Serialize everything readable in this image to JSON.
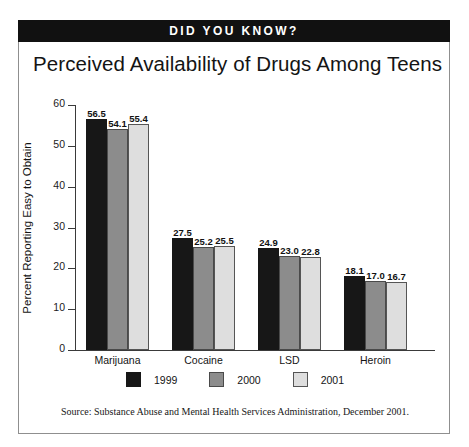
{
  "banner": {
    "text": "DID YOU KNOW?"
  },
  "chart_data": {
    "type": "bar",
    "title": "Perceived Availability of Drugs Among Teens",
    "xlabel": "",
    "ylabel": "Percent Reporting Easy to Obtain",
    "ylim": [
      0,
      60
    ],
    "yticks": [
      0,
      10,
      20,
      30,
      40,
      50,
      60
    ],
    "ytick_labels": [
      "0",
      "10",
      "20",
      "30",
      "40",
      "50",
      "60"
    ],
    "grid": false,
    "legend_position": "bottom-center",
    "categories": [
      "Marijuana",
      "Cocaine",
      "LSD",
      "Heroin"
    ],
    "series": [
      {
        "name": "1999",
        "color": "#171717",
        "values": [
          56.5,
          27.5,
          24.9,
          18.1
        ],
        "value_labels": [
          "56.5",
          "27.5",
          "24.9",
          "18.1"
        ]
      },
      {
        "name": "2000",
        "color": "#8c8c8c",
        "values": [
          54.1,
          25.2,
          23.0,
          17.0
        ],
        "value_labels": [
          "54.1",
          "25.2",
          "23.0",
          "17.0"
        ]
      },
      {
        "name": "2001",
        "color": "#dedede",
        "values": [
          55.4,
          25.5,
          22.8,
          16.7
        ],
        "value_labels": [
          "55.4",
          "25.5",
          "22.8",
          "16.7"
        ]
      }
    ]
  },
  "source": {
    "text": "Source:  Substance Abuse and Mental Health Services Administration, December 2001."
  }
}
